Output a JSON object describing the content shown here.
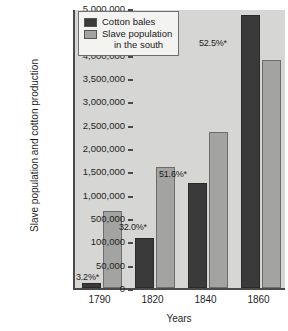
{
  "chart_data": {
    "type": "bar",
    "title": "",
    "xlabel": "Years",
    "ylabel": "Slave population and cotton production",
    "categories": [
      "1790",
      "1820",
      "1840",
      "1860"
    ],
    "series": [
      {
        "name": "Cotton bales",
        "color": "#3a3a3a",
        "values": [
          10000,
          160000,
          1250000,
          4860000
        ]
      },
      {
        "name": "Slave population in the south",
        "color": "#a3a3a1",
        "values": [
          660000,
          1600000,
          2350000,
          3890000
        ]
      }
    ],
    "ytick_labels": [
      "0",
      "50,000",
      "100,000",
      "500,000",
      "1,000,000",
      "1,500,000",
      "2,000,000",
      "2,500,000",
      "3,000,000",
      "3,500,000",
      "4,000,000",
      "4,500,000",
      "5,000,000"
    ],
    "ytick_values": [
      0,
      50000,
      100000,
      500000,
      1000000,
      1500000,
      2000000,
      2500000,
      3000000,
      3500000,
      4000000,
      4500000,
      5000000
    ],
    "axis_note": "y-axis ticks are evenly spaced but non-linear in value between 0 and 1,000,000",
    "grid": false,
    "legend_position": "top-left",
    "annotations": [
      {
        "text": "3.2%*",
        "category": "1790"
      },
      {
        "text": "32.0%*",
        "category": "1820"
      },
      {
        "text": "51.6%*",
        "category": "1840"
      },
      {
        "text": "52.5%*",
        "category": "1860"
      }
    ]
  },
  "legend": {
    "items": [
      {
        "label": "Cotton bales",
        "label_line2": ""
      },
      {
        "label": "Slave population",
        "label_line2": "in the south"
      }
    ]
  }
}
